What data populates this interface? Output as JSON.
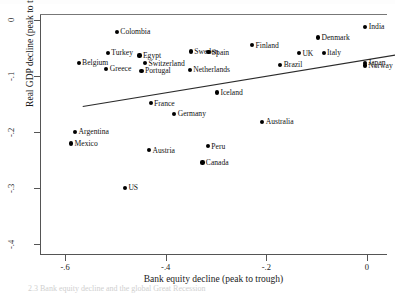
{
  "chart_data": {
    "type": "scatter",
    "title": "",
    "xlabel": "Bank equity decline (peak to trough)",
    "ylabel": "Real GDP decline (peak to trough)",
    "xlim": [
      -0.65,
      0.04
    ],
    "ylim": [
      -0.42,
      0.01
    ],
    "xticks": [
      "-.6",
      "-.4",
      "-.2",
      "0"
    ],
    "xtick_values": [
      -0.6,
      -0.4,
      -0.2,
      0
    ],
    "yticks": [
      "0",
      "-.1",
      "-.2",
      "-.3",
      "-.4"
    ],
    "ytick_values": [
      0,
      -0.1,
      -0.2,
      -0.3,
      -0.4
    ],
    "grid": false,
    "legend": "none",
    "fit_line": {
      "label": "linear fit",
      "x_start": -0.565,
      "y_start": -0.155,
      "x_end": 0.058,
      "y_end": -0.063
    },
    "points": [
      {
        "name": "India",
        "x": -0.003,
        "y": -0.013,
        "label_side": "right"
      },
      {
        "name": "Colombia",
        "x": -0.497,
        "y": -0.022,
        "label_side": "right"
      },
      {
        "name": "Denmark",
        "x": -0.097,
        "y": -0.032,
        "label_side": "right"
      },
      {
        "name": "Finland",
        "x": -0.228,
        "y": -0.046,
        "label_side": "right"
      },
      {
        "name": "Sweden",
        "x": -0.35,
        "y": -0.057,
        "label_side": "right"
      },
      {
        "name": "Spain",
        "x": -0.315,
        "y": -0.058,
        "label_side": "right"
      },
      {
        "name": "UK",
        "x": -0.135,
        "y": -0.06,
        "label_side": "right"
      },
      {
        "name": "Italy",
        "x": -0.086,
        "y": -0.059,
        "label_side": "right"
      },
      {
        "name": "Turkey",
        "x": -0.515,
        "y": -0.059,
        "label_side": "right"
      },
      {
        "name": "Egypt",
        "x": -0.452,
        "y": -0.064,
        "label_side": "right"
      },
      {
        "name": "Belgium",
        "x": -0.573,
        "y": -0.077,
        "label_side": "right"
      },
      {
        "name": "Switzerland",
        "x": -0.441,
        "y": -0.078,
        "label_side": "right"
      },
      {
        "name": "Brazil",
        "x": -0.172,
        "y": -0.081,
        "label_side": "right"
      },
      {
        "name": "Japan",
        "x": -0.004,
        "y": -0.077,
        "label_side": "right"
      },
      {
        "name": "Norway",
        "x": -0.004,
        "y": -0.082,
        "label_side": "right"
      },
      {
        "name": "Greece",
        "x": -0.518,
        "y": -0.088,
        "label_side": "right"
      },
      {
        "name": "Portugal",
        "x": -0.448,
        "y": -0.091,
        "label_side": "right"
      },
      {
        "name": "Netherlands",
        "x": -0.352,
        "y": -0.09,
        "label_side": "right"
      },
      {
        "name": "Iceland",
        "x": -0.298,
        "y": -0.13,
        "label_side": "right"
      },
      {
        "name": "France",
        "x": -0.43,
        "y": -0.149,
        "label_side": "right"
      },
      {
        "name": "Germany",
        "x": -0.383,
        "y": -0.168,
        "label_side": "right"
      },
      {
        "name": "Australia",
        "x": -0.208,
        "y": -0.182,
        "label_side": "right"
      },
      {
        "name": "Argentina",
        "x": -0.58,
        "y": -0.2,
        "label_side": "right"
      },
      {
        "name": "Mexico",
        "x": -0.588,
        "y": -0.221,
        "label_side": "right"
      },
      {
        "name": "Peru",
        "x": -0.316,
        "y": -0.226,
        "label_side": "right"
      },
      {
        "name": "Austria",
        "x": -0.433,
        "y": -0.233,
        "label_side": "right"
      },
      {
        "name": "Canada",
        "x": -0.327,
        "y": -0.255,
        "label_side": "right"
      },
      {
        "name": "US",
        "x": -0.481,
        "y": -0.3,
        "label_side": "right"
      }
    ]
  },
  "caption": {
    "text": "2.3 Bank equity decline and the global Great Recession"
  }
}
